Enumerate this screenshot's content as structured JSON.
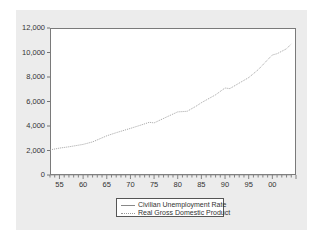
{
  "chart_data": {
    "type": "line",
    "title": "",
    "xlabel": "",
    "ylabel": "",
    "ylim": [
      0,
      12000
    ],
    "xlim": [
      1953,
      2005
    ],
    "y_ticks": [
      "0",
      "2,000",
      "4,000",
      "6,000",
      "8,000",
      "10,000",
      "12,000"
    ],
    "x_ticks": [
      "55",
      "60",
      "65",
      "70",
      "75",
      "80",
      "85",
      "90",
      "95",
      "00"
    ],
    "grid": false,
    "legend_position": "bottom-center",
    "x": [
      1953,
      1955,
      1957,
      1960,
      1962,
      1965,
      1967,
      1970,
      1972,
      1974,
      1975,
      1978,
      1980,
      1982,
      1984,
      1985,
      1988,
      1990,
      1991,
      1993,
      1995,
      1997,
      1999,
      2000,
      2001,
      2003,
      2004
    ],
    "series": [
      {
        "name": "Civilian Unemployment Rate",
        "style": "solid",
        "color": "#888888",
        "values": [
          2.9,
          4.4,
          4.3,
          5.5,
          5.5,
          4.5,
          3.8,
          4.9,
          5.6,
          5.6,
          8.5,
          6.1,
          7.2,
          9.7,
          7.5,
          7.2,
          5.5,
          5.6,
          6.8,
          6.9,
          5.6,
          4.9,
          4.2,
          4.0,
          4.7,
          6.0,
          5.5
        ]
      },
      {
        "name": "Real Gross Domestic Product",
        "style": "dotted",
        "color": "#999999",
        "values": [
          2050,
          2200,
          2300,
          2500,
          2700,
          3200,
          3450,
          3800,
          4050,
          4300,
          4250,
          4800,
          5150,
          5200,
          5650,
          5900,
          6550,
          7100,
          7050,
          7500,
          7950,
          8600,
          9400,
          9800,
          9900,
          10300,
          10700
        ]
      }
    ]
  },
  "legend": {
    "items": [
      {
        "label": "Civilian Unemployment Rate"
      },
      {
        "label": "Real Gross Domestic Product"
      }
    ]
  }
}
